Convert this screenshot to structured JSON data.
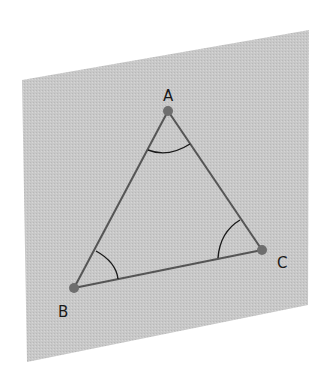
{
  "diagram": {
    "plane": {
      "fill": "#c9c9c9",
      "corners": [
        [
          22,
          80
        ],
        [
          309,
          30
        ],
        [
          308,
          305
        ],
        [
          27,
          362
        ]
      ]
    },
    "vertices": [
      {
        "label": "A",
        "x": 168,
        "y": 111,
        "label_x": 163,
        "label_y": 101
      },
      {
        "label": "B",
        "x": 74,
        "y": 288,
        "label_x": 58,
        "label_y": 317
      },
      {
        "label": "C",
        "x": 262,
        "y": 250,
        "label_x": 277,
        "label_y": 268
      }
    ],
    "edges": [
      [
        "A",
        "B"
      ],
      [
        "B",
        "C"
      ],
      [
        "C",
        "A"
      ]
    ],
    "angle_marks": [
      "A",
      "B",
      "C"
    ],
    "colors": {
      "edge": "#555555",
      "vertex": "#6e6e6e",
      "arc": "#1a1a1a"
    }
  }
}
